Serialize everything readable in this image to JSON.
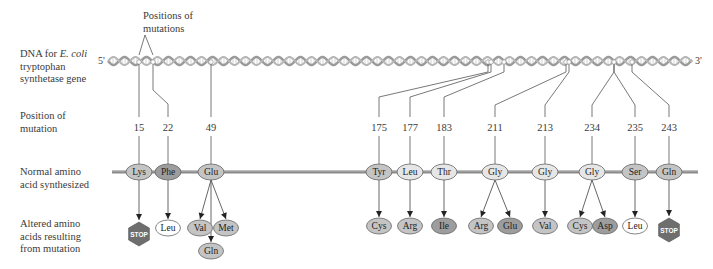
{
  "labels": {
    "callout": [
      "Positions of",
      "mutations"
    ],
    "dna_line1_pre": "DNA for ",
    "dna_line1_em": "E. coli",
    "dna_line2": "tryptophan",
    "dna_line3": "synthetase gene",
    "position": [
      "Position of",
      "mutation"
    ],
    "normal": [
      "Normal amino",
      "acid synthesized"
    ],
    "altered": [
      "Altered amino",
      "acids resulting",
      "from mutation"
    ],
    "five_prime": "5'",
    "three_prime": "3'"
  },
  "colors": {
    "helix": "#9a9a9a",
    "backbone": "#8a8a8a",
    "ellipse_light": "#e6e6e6",
    "ellipse_mid": "#c4c4c4",
    "ellipse_dark": "#9d9d9d",
    "ellipse_white": "#ffffff",
    "stop": "#6e6e6e",
    "line": "#555555"
  },
  "mutations": [
    {
      "position": "15",
      "x": 139,
      "dna_x": 139,
      "normal": "Lys",
      "normal_shade": "mid",
      "altered": [
        {
          "label": "STOP",
          "type": "stop",
          "x": 139,
          "y": 234
        }
      ]
    },
    {
      "position": "22",
      "x": 168,
      "dna_x": 153,
      "normal": "Phe",
      "normal_shade": "dark",
      "altered": [
        {
          "label": "Leu",
          "shade": "white",
          "x": 168,
          "y": 228
        }
      ]
    },
    {
      "position": "49",
      "x": 211,
      "dna_x": 211,
      "normal": "Glu",
      "normal_shade": "mid",
      "altered": [
        {
          "label": "Val",
          "shade": "mid",
          "x": 200,
          "y": 228
        },
        {
          "label": "Met",
          "shade": "mid",
          "x": 226,
          "y": 228
        },
        {
          "label": "Gln",
          "shade": "mid",
          "x": 211,
          "y": 251
        }
      ]
    },
    {
      "position": "175",
      "x": 379,
      "dna_x": 488,
      "normal": "Tyr",
      "normal_shade": "mid",
      "altered": [
        {
          "label": "Cys",
          "shade": "mid",
          "x": 379,
          "y": 226
        }
      ]
    },
    {
      "position": "177",
      "x": 410,
      "dna_x": 491,
      "normal": "Leu",
      "normal_shade": "light",
      "altered": [
        {
          "label": "Arg",
          "shade": "mid",
          "x": 410,
          "y": 226
        }
      ]
    },
    {
      "position": "183",
      "x": 444,
      "dna_x": 504,
      "normal": "Thr",
      "normal_shade": "light",
      "altered": [
        {
          "label": "Ile",
          "shade": "dark",
          "x": 444,
          "y": 226
        }
      ]
    },
    {
      "position": "211",
      "x": 495,
      "dna_x": 566,
      "normal": "Gly",
      "normal_shade": "light",
      "altered": [
        {
          "label": "Arg",
          "shade": "mid",
          "x": 481,
          "y": 226
        },
        {
          "label": "Glu",
          "shade": "dark",
          "x": 510,
          "y": 226
        }
      ]
    },
    {
      "position": "213",
      "x": 545,
      "dna_x": 569,
      "normal": "Gly",
      "normal_shade": "light",
      "altered": [
        {
          "label": "Val",
          "shade": "mid",
          "x": 545,
          "y": 226
        }
      ]
    },
    {
      "position": "234",
      "x": 592,
      "dna_x": 614,
      "normal": "Gly",
      "normal_shade": "light",
      "altered": [
        {
          "label": "Cys",
          "shade": "mid",
          "x": 580,
          "y": 226
        },
        {
          "label": "Asp",
          "shade": "dark",
          "x": 605,
          "y": 226
        }
      ]
    },
    {
      "position": "235",
      "x": 635,
      "dna_x": 614,
      "normal": "Ser",
      "normal_shade": "mid",
      "altered": [
        {
          "label": "Leu",
          "shade": "white",
          "x": 635,
          "y": 226
        }
      ]
    },
    {
      "position": "243",
      "x": 669,
      "dna_x": 632,
      "normal": "Gln",
      "normal_shade": "mid",
      "altered": [
        {
          "label": "STOP",
          "type": "stop",
          "x": 669,
          "y": 230
        }
      ]
    }
  ]
}
